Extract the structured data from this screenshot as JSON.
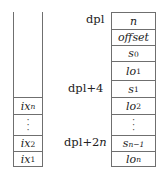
{
  "diagram": {
    "type": "memory-layout",
    "left_stack": {
      "cells": [
        {
          "id": "ix_n",
          "base": "ix",
          "sub": "n",
          "sub_italic": true
        },
        {
          "id": "vdots",
          "text": "⋮"
        },
        {
          "id": "ix_2",
          "base": "ix",
          "sub": "2",
          "sub_italic": false
        },
        {
          "id": "ix_1",
          "base": "ix",
          "sub": "1",
          "sub_italic": false
        }
      ]
    },
    "right_stack": {
      "cells": [
        {
          "id": "n",
          "base": "n",
          "sub": ""
        },
        {
          "id": "offset",
          "base": "offset",
          "sub": ""
        },
        {
          "id": "s_0",
          "base": "s",
          "sub": "0"
        },
        {
          "id": "lo_1",
          "base": "lo",
          "sub": "1"
        },
        {
          "id": "s_1",
          "base": "s",
          "sub": "1"
        },
        {
          "id": "lo_2",
          "base": "lo",
          "sub": "2"
        },
        {
          "id": "vdots",
          "text": "⋮"
        },
        {
          "id": "s_n-1",
          "base": "s",
          "sub": "n−1"
        },
        {
          "id": "lo_n",
          "base": "lo",
          "sub": "n"
        }
      ]
    },
    "address_labels": [
      {
        "text": "dpl",
        "prefix": "dpl",
        "suffix": ""
      },
      {
        "text": "dpl+4",
        "prefix": "dpl+4",
        "suffix": ""
      },
      {
        "text": "dpl+2n",
        "prefix": "dpl+2",
        "suffix": "n"
      }
    ],
    "colors": {
      "border": "#6f6f6f",
      "text": "#222222",
      "background": "#ffffff"
    }
  }
}
